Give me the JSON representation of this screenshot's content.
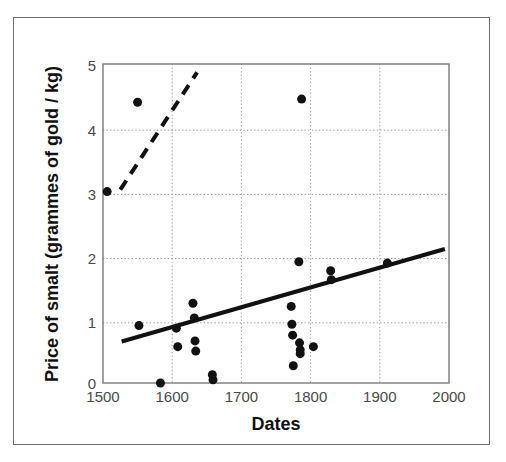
{
  "figure": {
    "background_color": "#ffffff",
    "frame_color": "#6e6e6e",
    "plot_border_color": "#7a7a7a",
    "marker_color": "#111111",
    "trend_color": "#111111",
    "gridline_color": "#9a9a9a"
  },
  "chart_data": {
    "type": "scatter",
    "title": "",
    "xlabel": "Dates",
    "ylabel": "Price of smalt  (grammes of gold / kg)",
    "xlim": [
      1500,
      2000
    ],
    "ylim": [
      0,
      5
    ],
    "xticks": [
      1500,
      1600,
      1700,
      1800,
      1900,
      2000
    ],
    "xticklabels": [
      "1500",
      "1600",
      "1700",
      "1800",
      "1900",
      "2000"
    ],
    "yticks": [
      0,
      1,
      2,
      3,
      4,
      5
    ],
    "yticklabels": [
      "0",
      "1",
      "2",
      "3",
      "4",
      "5"
    ],
    "grid": true,
    "grid_style": "dotted",
    "legend": "none",
    "marker_style": "filled-circle",
    "marker_size_px": 9,
    "points": [
      {
        "x": 1506,
        "y": 3.0
      },
      {
        "x": 1550,
        "y": 4.4
      },
      {
        "x": 1552,
        "y": 0.9
      },
      {
        "x": 1583,
        "y": 0.0
      },
      {
        "x": 1606,
        "y": 0.86
      },
      {
        "x": 1608,
        "y": 0.57
      },
      {
        "x": 1630,
        "y": 1.25
      },
      {
        "x": 1632,
        "y": 1.02
      },
      {
        "x": 1633,
        "y": 0.66
      },
      {
        "x": 1634,
        "y": 0.5
      },
      {
        "x": 1658,
        "y": 0.13
      },
      {
        "x": 1659,
        "y": 0.05
      },
      {
        "x": 1772,
        "y": 1.2
      },
      {
        "x": 1773,
        "y": 0.92
      },
      {
        "x": 1774,
        "y": 0.75
      },
      {
        "x": 1775,
        "y": 0.27
      },
      {
        "x": 1783,
        "y": 1.9
      },
      {
        "x": 1784,
        "y": 0.63
      },
      {
        "x": 1785,
        "y": 0.52
      },
      {
        "x": 1785,
        "y": 0.46
      },
      {
        "x": 1787,
        "y": 4.45
      },
      {
        "x": 1804,
        "y": 0.57
      },
      {
        "x": 1829,
        "y": 1.76
      },
      {
        "x": 1830,
        "y": 1.62
      },
      {
        "x": 1911,
        "y": 1.88
      }
    ],
    "trend_lines": [
      {
        "name": "solid-regression-line",
        "style": "solid",
        "width_px": 4,
        "x_start": 1527,
        "y_start": 0.65,
        "x_end": 1994,
        "y_end": 2.1
      },
      {
        "name": "dashed-early-trend-line",
        "style": "dashed",
        "width_px": 4,
        "x_start": 1525,
        "y_start": 3.03,
        "x_end": 1636,
        "y_end": 4.87
      }
    ]
  }
}
